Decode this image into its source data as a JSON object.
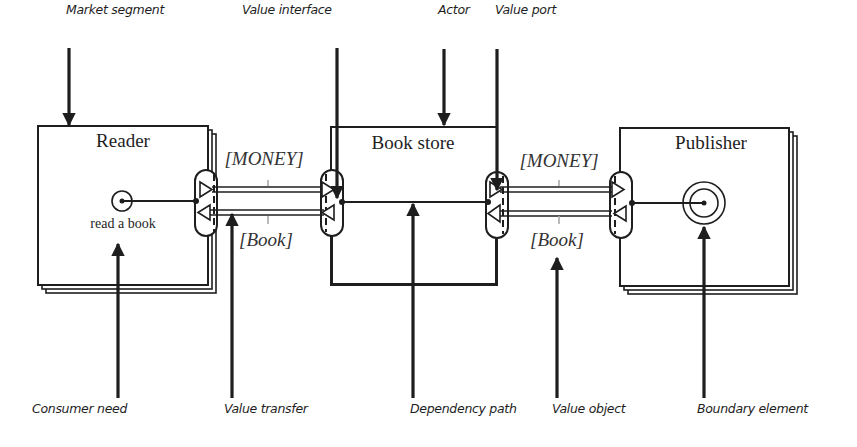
{
  "diagram": {
    "colors": {
      "ink": "#1e1e1e",
      "transfer_fill": "#ffffff",
      "tick": "#aaaaaa"
    },
    "annotations": [
      {
        "id": "market-segment",
        "text": "Market segment",
        "x": 66,
        "y": 2
      },
      {
        "id": "value-interface",
        "text": "Value interface",
        "x": 242,
        "y": 2
      },
      {
        "id": "actor",
        "text": "Actor",
        "x": 438,
        "y": 2
      },
      {
        "id": "value-port",
        "text": "Value port",
        "x": 495,
        "y": 2
      },
      {
        "id": "consumer-need",
        "text": "Consumer need",
        "x": 32,
        "y": 401
      },
      {
        "id": "value-transfer",
        "text": "Value transfer",
        "x": 224,
        "y": 401
      },
      {
        "id": "dependency-path",
        "text": "Dependency path",
        "x": 410,
        "y": 401
      },
      {
        "id": "value-object",
        "text": "Value object",
        "x": 552,
        "y": 401
      },
      {
        "id": "boundary-element",
        "text": "Boundary  element",
        "x": 697,
        "y": 401
      }
    ],
    "actors": [
      {
        "id": "reader",
        "name": "Reader",
        "kind": "market-segment",
        "cx": 123,
        "ny": 130
      },
      {
        "id": "book-store",
        "name": "Book store",
        "kind": "actor",
        "cx": 413,
        "ny": 132
      },
      {
        "id": "publisher",
        "name": "Publisher",
        "kind": "market-segment",
        "cx": 711,
        "ny": 132
      }
    ],
    "consumer_need": {
      "label": "read a book",
      "cx": 123,
      "y": 216
    },
    "value_objects": [
      {
        "id": "money-left",
        "label": "[MONEY]",
        "cx": 264,
        "y": 148
      },
      {
        "id": "book-left",
        "label": "[Book]",
        "cx": 266,
        "y": 229
      },
      {
        "id": "money-right",
        "label": "[MONEY]",
        "cx": 559,
        "y": 150
      },
      {
        "id": "book-right",
        "label": "[Book]",
        "cx": 557,
        "y": 229
      }
    ]
  }
}
